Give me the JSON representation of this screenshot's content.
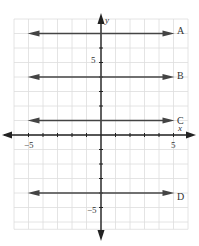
{
  "chart_data": {
    "type": "line",
    "title": "",
    "xlabel": "x",
    "ylabel": "y",
    "xlim": [
      -6,
      6
    ],
    "ylim": [
      -6,
      8
    ],
    "grid": true,
    "x_tick_labels": [
      "-5",
      "5"
    ],
    "y_tick_labels": [
      "5",
      "-5"
    ],
    "series": [
      {
        "name": "A",
        "equation": "y = 7",
        "y": 7,
        "x_range": [
          -5,
          5
        ]
      },
      {
        "name": "B",
        "equation": "y = 4",
        "y": 4,
        "x_range": [
          -5,
          5
        ]
      },
      {
        "name": "C",
        "equation": "y = 1",
        "y": 1,
        "x_range": [
          -5,
          5
        ]
      },
      {
        "name": "D",
        "equation": "y = -4",
        "y": -4,
        "x_range": [
          -5,
          5
        ]
      }
    ]
  },
  "labels": {
    "x_axis": "x",
    "y_axis": "y",
    "x_neg5": "−5",
    "x_pos5": "5",
    "y_pos5": "5",
    "y_neg5": "−5",
    "line_a": "A",
    "line_b": "B",
    "line_c": "C",
    "line_d": "D"
  },
  "colors": {
    "grid": "#dddddd",
    "axis": "#222222",
    "line": "#444444"
  }
}
